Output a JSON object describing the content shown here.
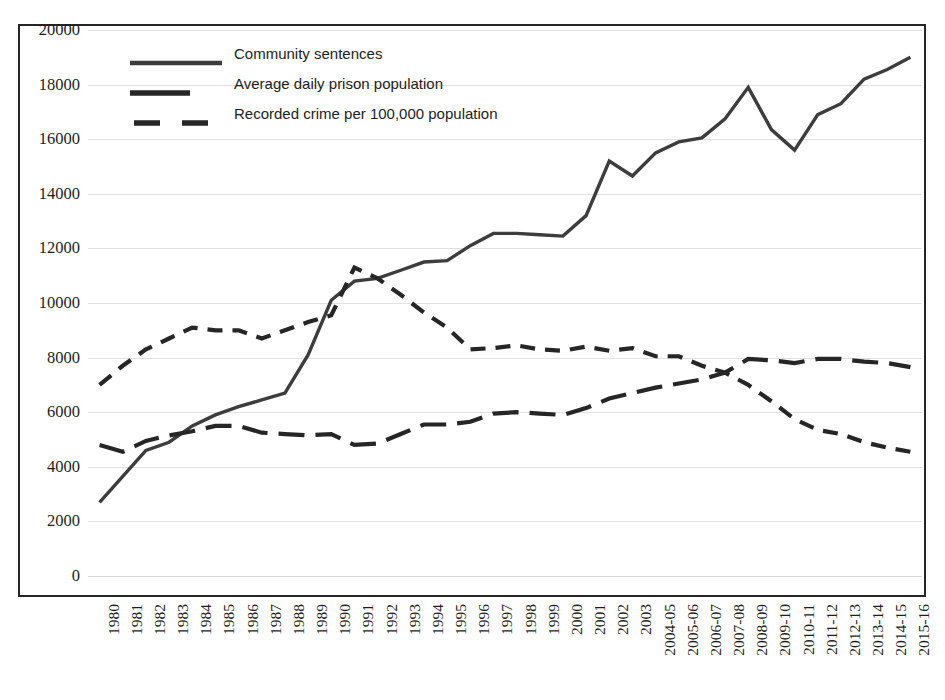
{
  "chart_data": {
    "type": "line",
    "title": "",
    "xlabel": "",
    "ylabel": "",
    "ylim": [
      0,
      20000
    ],
    "ytick_step": 2000,
    "yticks": [
      "20000",
      "18000",
      "16000",
      "14000",
      "12000",
      "10000",
      "8000",
      "6000",
      "4000",
      "2000",
      "0"
    ],
    "grid": true,
    "legend_position": "top-center-inside",
    "categories": [
      "1980",
      "1981",
      "1982",
      "1983",
      "1984",
      "1985",
      "1986",
      "1987",
      "1988",
      "1989",
      "1990",
      "1991",
      "1992",
      "1993",
      "1994",
      "1995",
      "1996",
      "1997",
      "1998",
      "1999",
      "2000",
      "2001",
      "2002",
      "2003",
      "2004-05",
      "2005-06",
      "2006-07",
      "2007-08",
      "2008-09",
      "2009-10",
      "2010-11",
      "2011-12",
      "2012-13",
      "2013-14",
      "2014-15",
      "2015-16"
    ],
    "series": [
      {
        "name": "Community sentences",
        "style": "solid",
        "color": "#3d3d3d",
        "values": [
          2700,
          3650,
          4600,
          4900,
          5500,
          5900,
          6200,
          6450,
          6700,
          8100,
          10100,
          10800,
          10900,
          11200,
          11500,
          11550,
          12100,
          12550,
          12550,
          12500,
          12450,
          13200,
          15200,
          14650,
          15500,
          15900,
          16050,
          16750,
          17900,
          16350,
          15600,
          16900,
          17300,
          18200,
          18550,
          19000
        ]
      },
      {
        "name": "Average daily prison population",
        "style": "dashed-long",
        "color": "#262626",
        "values": [
          4800,
          4550,
          4950,
          5150,
          5300,
          5500,
          5500,
          5250,
          5200,
          5150,
          5200,
          4800,
          4850,
          5200,
          5550,
          5550,
          5650,
          5950,
          6000,
          5950,
          5900,
          6150,
          6500,
          6700,
          6900,
          7050,
          7200,
          7450,
          7950,
          7900,
          7800,
          7950,
          7950,
          7850,
          7800,
          7650
        ]
      },
      {
        "name": "Recorded crime per 100,000 population",
        "style": "dashed-short",
        "color": "#262626",
        "values": [
          7000,
          7700,
          8300,
          8700,
          9100,
          9000,
          9000,
          8700,
          9000,
          9300,
          9550,
          11300,
          10900,
          10300,
          9650,
          9100,
          8300,
          8350,
          8450,
          8300,
          8250,
          8400,
          8250,
          8350,
          8050,
          8050,
          7700,
          7450,
          7000,
          6400,
          5750,
          5350,
          5200,
          4900,
          4700,
          4550
        ]
      }
    ]
  },
  "legend": {
    "items": [
      {
        "label": "Community sentences",
        "key": "legend-key-solid"
      },
      {
        "label": "Average daily prison population",
        "key": "legend-key-dash-long"
      },
      {
        "label": "Recorded crime per 100,000 population",
        "key": "legend-key-dash-short"
      }
    ]
  },
  "colors": {
    "line_community": "#3d3d3d",
    "line_prison": "#262626",
    "line_crime": "#262626",
    "gridline": "#e2e2e2",
    "frame": "#262626",
    "text": "#1d1d1d"
  }
}
